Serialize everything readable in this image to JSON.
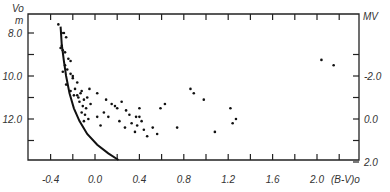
{
  "chart_data": {
    "type": "scatter",
    "title": "",
    "xlabel": "(B-V)o",
    "ylabel_left_top": "Vo",
    "ylabel_left_sub": "m",
    "ylabel_right": "MV",
    "xlim": [
      -0.6,
      2.3
    ],
    "ylim_left": [
      7.0,
      13.8
    ],
    "y_inverted": true,
    "x_ticks": [
      -0.4,
      -0.2,
      0.0,
      0.2,
      0.4,
      0.6,
      0.8,
      1.0,
      1.2,
      1.4,
      1.6,
      1.8,
      2.0,
      2.2
    ],
    "x_tick_labels": [
      {
        "value": -0.4,
        "text": "-0.4"
      },
      {
        "value": 0.0,
        "text": "0.0"
      },
      {
        "value": 0.4,
        "text": "0.4"
      },
      {
        "value": 0.8,
        "text": "0.8"
      },
      {
        "value": 1.2,
        "text": "1.2"
      },
      {
        "value": 1.6,
        "text": "1.6"
      },
      {
        "value": 2.0,
        "text": "2.0"
      }
    ],
    "left_ticks": [
      8.0,
      9.0,
      10.0,
      11.0,
      12.0,
      13.0
    ],
    "left_tick_labels": [
      {
        "value": 8.0,
        "text": "8.0"
      },
      {
        "value": 10.0,
        "text": "10.0"
      },
      {
        "value": 12.0,
        "text": "12.0"
      }
    ],
    "right_axis_offset": -12.0,
    "right_ticks": [
      -3.0,
      -2.0,
      -1.0,
      0.0,
      1.0,
      2.0
    ],
    "right_tick_labels": [
      {
        "value": -2.0,
        "text": "-2.0"
      },
      {
        "value": 0.0,
        "text": "0.0"
      },
      {
        "value": 2.0,
        "text": "2.0"
      }
    ],
    "grid": false,
    "series": [
      {
        "name": "stars",
        "kind": "points",
        "points": [
          [
            -0.33,
            7.6
          ],
          [
            -0.3,
            8.0
          ],
          [
            -0.28,
            8.0
          ],
          [
            -0.26,
            8.2
          ],
          [
            -0.3,
            8.6
          ],
          [
            -0.29,
            8.8
          ],
          [
            -0.27,
            8.9
          ],
          [
            -0.31,
            8.7
          ],
          [
            -0.24,
            9.2
          ],
          [
            -0.22,
            9.3
          ],
          [
            -0.27,
            9.5
          ],
          [
            -0.25,
            9.7
          ],
          [
            -0.29,
            9.8
          ],
          [
            -0.22,
            9.9
          ],
          [
            -0.2,
            10.0
          ],
          [
            -0.26,
            10.4
          ],
          [
            -0.16,
            10.3
          ],
          [
            -0.2,
            10.1
          ],
          [
            -0.18,
            10.6
          ],
          [
            -0.13,
            10.8
          ],
          [
            -0.16,
            10.9
          ],
          [
            -0.12,
            10.7
          ],
          [
            -0.05,
            10.6
          ],
          [
            -0.22,
            10.7
          ],
          [
            -0.19,
            10.9
          ],
          [
            -0.15,
            11.0
          ],
          [
            -0.1,
            11.1
          ],
          [
            -0.07,
            11.0
          ],
          [
            0.02,
            10.8
          ],
          [
            -0.14,
            11.2
          ],
          [
            -0.11,
            11.4
          ],
          [
            -0.08,
            11.5
          ],
          [
            -0.04,
            11.3
          ],
          [
            -0.12,
            11.7
          ],
          [
            -0.09,
            11.8
          ],
          [
            -0.06,
            12.0
          ],
          [
            0.02,
            11.9
          ],
          [
            -0.1,
            12.1
          ],
          [
            0.05,
            12.3
          ],
          [
            0.1,
            11.1
          ],
          [
            0.15,
            11.3
          ],
          [
            0.18,
            11.4
          ],
          [
            0.08,
            11.7
          ],
          [
            0.12,
            11.9
          ],
          [
            0.2,
            11.5
          ],
          [
            0.24,
            11.2
          ],
          [
            0.28,
            11.6
          ],
          [
            0.31,
            11.8
          ],
          [
            0.22,
            12.1
          ],
          [
            0.27,
            12.4
          ],
          [
            0.33,
            12.2
          ],
          [
            0.37,
            11.9
          ],
          [
            0.38,
            12.3
          ],
          [
            0.36,
            12.6
          ],
          [
            0.4,
            11.9
          ],
          [
            0.4,
            11.5
          ],
          [
            0.42,
            12.1
          ],
          [
            0.44,
            12.5
          ],
          [
            0.47,
            12.8
          ],
          [
            0.52,
            12.4
          ],
          [
            0.56,
            12.7
          ],
          [
            0.59,
            11.5
          ],
          [
            0.63,
            11.3
          ],
          [
            0.74,
            12.4
          ],
          [
            0.86,
            10.6
          ],
          [
            0.89,
            10.8
          ],
          [
            0.98,
            11.1
          ],
          [
            1.08,
            12.6
          ],
          [
            1.22,
            11.5
          ],
          [
            1.24,
            12.2
          ],
          [
            1.27,
            12.0
          ],
          [
            2.04,
            9.25
          ],
          [
            2.15,
            9.5
          ]
        ]
      },
      {
        "name": "ZAMS",
        "kind": "curve",
        "points": [
          [
            -0.31,
            7.7
          ],
          [
            -0.3,
            8.5
          ],
          [
            -0.28,
            9.3
          ],
          [
            -0.26,
            10.0
          ],
          [
            -0.23,
            10.8
          ],
          [
            -0.19,
            11.5
          ],
          [
            -0.14,
            12.1
          ],
          [
            -0.07,
            12.7
          ],
          [
            0.02,
            13.2
          ],
          [
            0.12,
            13.6
          ],
          [
            0.24,
            14.0
          ]
        ]
      }
    ]
  }
}
